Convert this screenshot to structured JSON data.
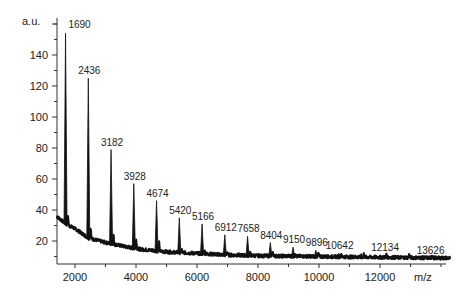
{
  "chart_data": {
    "type": "line",
    "title": "",
    "xlabel": "m/z",
    "ylabel": "a.u.",
    "xlim": [
      1400,
      14300
    ],
    "ylim": [
      5,
      160
    ],
    "x_ticks": [
      2000,
      4000,
      6000,
      8000,
      10000,
      12000
    ],
    "x_tick_labels": [
      "2000",
      "4000",
      "6000",
      "8000",
      "10000",
      "12000"
    ],
    "x_minor_ticks": [
      3000,
      5000,
      7000,
      9000,
      11000,
      13000,
      14000
    ],
    "y_ticks": [
      20,
      40,
      60,
      80,
      100,
      120,
      140
    ],
    "y_tick_labels": [
      "20",
      "40",
      "60",
      "80",
      "100",
      "120",
      "140"
    ],
    "y_minor_ticks": [
      10,
      30,
      50,
      70,
      90,
      110,
      130,
      150,
      160
    ],
    "grid": false,
    "legend": null,
    "baseline": {
      "x": [
        1400,
        1700,
        2000,
        2436,
        3000,
        3500,
        4000,
        5000,
        6000,
        7000,
        8000,
        10000,
        12000,
        14300
      ],
      "y": [
        36,
        31,
        28,
        22,
        19,
        17,
        15,
        13,
        12,
        11,
        10.5,
        10,
        9.5,
        9
      ]
    },
    "peaks": [
      {
        "mz": 1690,
        "label": "1690",
        "intensity": 154
      },
      {
        "mz": 2436,
        "label": "2436",
        "intensity": 125
      },
      {
        "mz": 3182,
        "label": "3182",
        "intensity": 79
      },
      {
        "mz": 3928,
        "label": "3928",
        "intensity": 57
      },
      {
        "mz": 4674,
        "label": "4674",
        "intensity": 46
      },
      {
        "mz": 5420,
        "label": "5420",
        "intensity": 35
      },
      {
        "mz": 6166,
        "label": "5166",
        "intensity": 31
      },
      {
        "mz": 6912,
        "label": "6912",
        "intensity": 24
      },
      {
        "mz": 7658,
        "label": "7658",
        "intensity": 23
      },
      {
        "mz": 8404,
        "label": "8404",
        "intensity": 19
      },
      {
        "mz": 9150,
        "label": "9150",
        "intensity": 16
      },
      {
        "mz": 9896,
        "label": "9896",
        "intensity": 14
      },
      {
        "mz": 10642,
        "label": "10642",
        "intensity": 12
      },
      {
        "mz": 11388,
        "label": "",
        "intensity": 12
      },
      {
        "mz": 12134,
        "label": "12134",
        "intensity": 11
      },
      {
        "mz": 12880,
        "label": "",
        "intensity": 10
      },
      {
        "mz": 13626,
        "label": "13626",
        "intensity": 9
      }
    ],
    "annotations": [
      "1690",
      "2436",
      "3182",
      "3928",
      "4674",
      "5420",
      "5166",
      "6912",
      "7658",
      "8404",
      "9150",
      "9896",
      "10642",
      "12134",
      "13626"
    ]
  },
  "labels": {
    "y_unit": "a.u.",
    "x_unit": "m/z"
  }
}
